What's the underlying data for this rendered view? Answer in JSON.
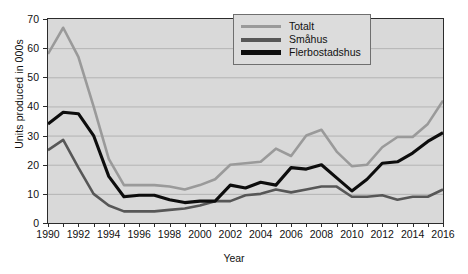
{
  "chart_data": {
    "type": "line",
    "title": "",
    "xlabel": "Year",
    "ylabel": "Units produced in 000s",
    "xlim": [
      1990,
      2016
    ],
    "ylim": [
      0,
      70
    ],
    "ytick_step": 10,
    "xtick_step": 1,
    "xlabel_step": 2,
    "grid": true,
    "grid_axis": "y",
    "legend_position": "top-right",
    "plot_background": "#d9d9d9",
    "x": [
      1990,
      1991,
      1992,
      1993,
      1994,
      1995,
      1996,
      1997,
      1998,
      1999,
      2000,
      2001,
      2002,
      2003,
      2004,
      2005,
      2006,
      2007,
      2008,
      2009,
      2010,
      2011,
      2012,
      2013,
      2014,
      2015,
      2016
    ],
    "xtick_labels": [
      "1990",
      "1992",
      "1994",
      "1996",
      "1998",
      "2000",
      "2002",
      "2004",
      "2006",
      "2008",
      "2010",
      "2012",
      "2014",
      "2016"
    ],
    "ytick_labels": [
      "0",
      "10",
      "20",
      "30",
      "40",
      "50",
      "60",
      "70"
    ],
    "series": [
      {
        "name": "Totalt",
        "color": "#9a9a9a",
        "width": 2.6,
        "values": [
          58,
          67,
          57,
          40,
          22,
          13,
          13,
          13,
          12.5,
          11.5,
          13,
          15,
          20,
          20.5,
          21,
          25.5,
          23,
          30,
          32,
          24.5,
          19.5,
          20,
          26,
          29.5,
          29.5,
          34,
          42
        ]
      },
      {
        "name": "Småhus",
        "color": "#575757",
        "width": 2.6,
        "values": [
          25,
          28.5,
          19,
          10,
          6,
          4,
          4,
          4,
          4.5,
          5,
          6,
          7.5,
          7.5,
          9.5,
          10,
          11.5,
          10.5,
          11.5,
          12.5,
          12.5,
          9,
          9,
          9.5,
          8,
          9,
          9,
          11.5
        ]
      },
      {
        "name": "Flerbostadshus",
        "color": "#0d0d0d",
        "width": 3.1,
        "values": [
          34,
          38,
          37.5,
          30,
          16,
          9,
          9.5,
          9.5,
          8,
          7,
          7.5,
          7.5,
          13,
          12,
          14,
          13,
          19,
          18.5,
          20,
          15.5,
          11,
          15,
          20.5,
          21,
          24,
          28,
          31
        ]
      }
    ]
  },
  "legend": {
    "items": [
      {
        "label": "Totalt",
        "color": "#9a9a9a"
      },
      {
        "label": "Småhus",
        "color": "#575757"
      },
      {
        "label": "Flerbostadshus",
        "color": "#0d0d0d"
      }
    ]
  }
}
